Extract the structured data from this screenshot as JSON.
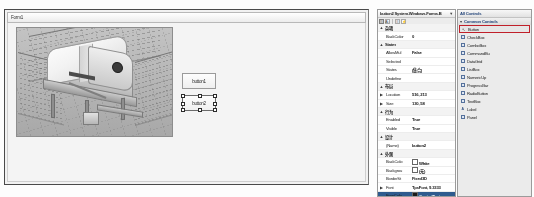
{
  "designer": {
    "form_title": "Form1",
    "picturebox_name": "3d-machine-render",
    "buttons": [
      {
        "label": "button1",
        "name": "button1"
      },
      {
        "label": "button2",
        "name": "button2"
      }
    ]
  },
  "properties": {
    "object_label": "button2  System.Windows.Forms.B",
    "dropdown_glyph": "▼",
    "toolbar": {
      "categorized": "☷",
      "alphabetical": "A↓",
      "properties": "☰",
      "events": "⚡"
    },
    "rows": [
      {
        "expander": "▲",
        "name": "杂项",
        "value": "",
        "category": true
      },
      {
        "expander": "",
        "name": "BackColor",
        "value": "0"
      },
      {
        "expander": "▲",
        "name": "States",
        "value": "",
        "category": true
      },
      {
        "expander": "",
        "name": "AllowMul",
        "value": "False"
      },
      {
        "expander": "",
        "name": "Selected",
        "value": ""
      },
      {
        "expander": "",
        "name": "States",
        "value": "(集合)"
      },
      {
        "expander": "",
        "name": "Undefine",
        "value": ""
      },
      {
        "expander": "▲",
        "name": "布局",
        "value": "",
        "category": true
      },
      {
        "expander": "▶",
        "name": "Location",
        "value": "516, 213"
      },
      {
        "expander": "▶",
        "name": "Size",
        "value": "130, 58"
      },
      {
        "expander": "▲",
        "name": "行为",
        "value": "",
        "category": true
      },
      {
        "expander": "",
        "name": "Enabled",
        "value": "True"
      },
      {
        "expander": "",
        "name": "Visible",
        "value": "True"
      },
      {
        "expander": "▲",
        "name": "设计",
        "value": "",
        "category": true
      },
      {
        "expander": "",
        "name": "(Name)",
        "value": "button2"
      },
      {
        "expander": "▲",
        "name": "外观",
        "value": "",
        "category": true
      },
      {
        "expander": "",
        "name": "BackColo",
        "value": "White",
        "swatch": "white"
      },
      {
        "expander": "",
        "name": "Backgrou",
        "value": "(无)",
        "swatch": "none"
      },
      {
        "expander": "",
        "name": "BorderSt",
        "value": "Fixed3D"
      },
      {
        "expander": "▶",
        "name": "Font",
        "value": "TpsFont, 9.3333"
      },
      {
        "expander": "",
        "name": "ForeColo",
        "value": "ControlText",
        "swatch": "dark",
        "selected": true
      }
    ]
  },
  "toolbox": {
    "header": "All Controls",
    "group": "Common Controls",
    "group_arrow": "▼",
    "items": [
      {
        "label": "Button",
        "icon": "pointer",
        "selected": true
      },
      {
        "label": "CheckBox",
        "icon": "square"
      },
      {
        "label": "ComboBox",
        "icon": "square"
      },
      {
        "label": "CommandBu",
        "icon": "square"
      },
      {
        "label": "DataGrid",
        "icon": "square"
      },
      {
        "label": "ListBox",
        "icon": "square"
      },
      {
        "label": "NumericUp",
        "icon": "square"
      },
      {
        "label": "ProgressBar",
        "icon": "square"
      },
      {
        "label": "RadioButton",
        "icon": "square"
      },
      {
        "label": "TextBox",
        "icon": "square"
      },
      {
        "label": "Label",
        "icon": "ab"
      },
      {
        "label": "Panel",
        "icon": "square"
      }
    ]
  }
}
